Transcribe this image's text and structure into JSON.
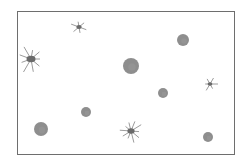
{
  "image": {
    "width": 249,
    "height": 162,
    "description": "Grayscale illustration of scattered particles inside a rectangular frame: round fuzzy blobs and star-shaped spiky particles",
    "frame": {
      "x": 17,
      "y": 11,
      "w": 218,
      "h": 144,
      "color": "#6e6e6e"
    },
    "particle_color": "#7a7a7a",
    "blobs": [
      {
        "cx": 131,
        "cy": 66,
        "r": 8
      },
      {
        "cx": 183,
        "cy": 40,
        "r": 6
      },
      {
        "cx": 163,
        "cy": 93,
        "r": 5
      },
      {
        "cx": 86,
        "cy": 112,
        "r": 5
      },
      {
        "cx": 41,
        "cy": 129,
        "r": 7
      },
      {
        "cx": 208,
        "cy": 137,
        "r": 5
      }
    ],
    "stars": [
      {
        "cx": 31,
        "cy": 59,
        "r": 15,
        "rays": 9
      },
      {
        "cx": 131,
        "cy": 131,
        "r": 12,
        "rays": 10
      },
      {
        "cx": 79,
        "cy": 27,
        "r": 9,
        "rays": 6
      },
      {
        "cx": 210,
        "cy": 84,
        "r": 8,
        "rays": 6
      }
    ]
  }
}
